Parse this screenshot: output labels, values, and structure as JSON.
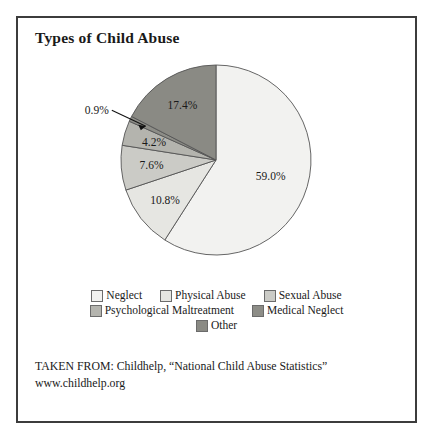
{
  "figure": {
    "title": "Types of Child Abuse",
    "source_line_1": "TAKEN FROM: Childhelp, “National Child Abuse Statistics”",
    "source_line_2": "www.childhelp.org"
  },
  "chart_data": {
    "type": "pie",
    "title": "Types of Child Abuse",
    "xlabel": "",
    "ylabel": "",
    "unit": "percent",
    "start_angle_deg": 0,
    "direction": "clockwise",
    "legend_position": "bottom",
    "grid": false,
    "categories": [
      "Neglect",
      "Physical Abuse",
      "Sexual Abuse",
      "Psychological Maltreatment",
      "Medical Neglect",
      "Other"
    ],
    "values": [
      59.0,
      10.8,
      7.6,
      4.2,
      0.9,
      17.4
    ],
    "value_labels": [
      "59.0%",
      "10.8%",
      "7.6%",
      "4.2%",
      "0.9%",
      "17.4%"
    ],
    "colors": [
      "#f2f2f0",
      "#e6e6e2",
      "#cbcbc6",
      "#b4b4ae",
      "#8d8d87",
      "#8a8a84"
    ],
    "slices": [
      {
        "label": "Neglect",
        "value": 59.0,
        "value_label": "59.0%",
        "color": "#f2f2f0",
        "callout": false
      },
      {
        "label": "Physical Abuse",
        "value": 10.8,
        "value_label": "10.8%",
        "color": "#e6e6e2",
        "callout": false
      },
      {
        "label": "Sexual Abuse",
        "value": 7.6,
        "value_label": "7.6%",
        "color": "#cbcbc6",
        "callout": false
      },
      {
        "label": "Psychological Maltreatment",
        "value": 4.2,
        "value_label": "4.2%",
        "color": "#b4b4ae",
        "callout": false
      },
      {
        "label": "Medical Neglect",
        "value": 0.9,
        "value_label": "0.9%",
        "color": "#8d8d87",
        "callout": true
      },
      {
        "label": "Other",
        "value": 17.4,
        "value_label": "17.4%",
        "color": "#8a8a84",
        "callout": false
      }
    ]
  },
  "legend": {
    "rows": [
      [
        {
          "label": "Neglect",
          "color": "#f2f2f0"
        },
        {
          "label": "Physical Abuse",
          "color": "#e6e6e2"
        },
        {
          "label": "Sexual Abuse",
          "color": "#cbcbc6"
        }
      ],
      [
        {
          "label": "Psychological Maltreatment",
          "color": "#b4b4ae"
        },
        {
          "label": "Medical Neglect",
          "color": "#8d8d87"
        }
      ],
      [
        {
          "label": "Other",
          "color": "#8a8a84"
        }
      ]
    ]
  }
}
